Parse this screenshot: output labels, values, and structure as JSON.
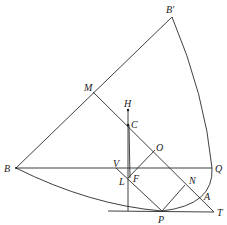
{
  "diagram": {
    "type": "geometry",
    "stroke_color": "#2a2a2a",
    "points": {
      "B_prime": {
        "label": "B′",
        "x": 172,
        "y": 17
      },
      "M": {
        "label": "M",
        "x": 93,
        "y": 92
      },
      "H": {
        "label": "H",
        "x": 128,
        "y": 110
      },
      "C": {
        "label": "C",
        "x": 128,
        "y": 125
      },
      "O": {
        "label": "O",
        "x": 155,
        "y": 150
      },
      "B": {
        "label": "B",
        "x": 16,
        "y": 168
      },
      "V": {
        "label": "V",
        "x": 116,
        "y": 168
      },
      "Q": {
        "label": "Q",
        "x": 212,
        "y": 168
      },
      "F": {
        "label": "F",
        "x": 130,
        "y": 176
      },
      "L": {
        "label": "L",
        "x": 128,
        "y": 178
      },
      "N": {
        "label": "N",
        "x": 185,
        "y": 185
      },
      "A": {
        "label": "A",
        "x": 200,
        "y": 195
      },
      "P": {
        "label": "P",
        "x": 162,
        "y": 211
      },
      "T": {
        "label": "T",
        "x": 214,
        "y": 212
      }
    },
    "segments": [
      [
        "B",
        "B_prime"
      ],
      [
        "B",
        "Q"
      ],
      [
        "M",
        "T"
      ],
      [
        "H",
        "L_foot"
      ],
      [
        "C",
        "L"
      ],
      [
        "V",
        "P"
      ],
      [
        "F",
        "O"
      ],
      [
        "P",
        "N"
      ],
      [
        "tangent_start",
        "T"
      ]
    ],
    "curves": [
      "B_prime-Q-A-P arc",
      "B-P arc"
    ]
  }
}
